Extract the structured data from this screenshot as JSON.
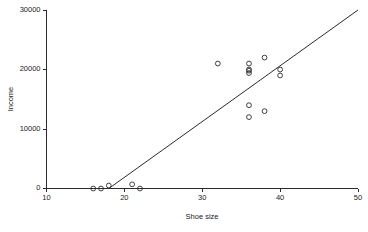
{
  "chart_data": {
    "type": "scatter",
    "title": "",
    "xlabel": "Shoe size",
    "ylabel": "Income",
    "xlim": [
      10,
      50
    ],
    "ylim": [
      0,
      30000
    ],
    "xticks": [
      10,
      20,
      30,
      40,
      50
    ],
    "yticks": [
      0,
      10000,
      20000,
      30000
    ],
    "xtick_labels": [
      "10",
      "20",
      "30",
      "40",
      "50"
    ],
    "ytick_labels": [
      "0",
      "10000",
      "20000",
      "30000"
    ],
    "grid": false,
    "legend": false,
    "marker": "open-circle",
    "marker_color": "#2b2b2b",
    "points": [
      {
        "x": 16,
        "y": 0
      },
      {
        "x": 17,
        "y": 0
      },
      {
        "x": 18,
        "y": 500
      },
      {
        "x": 21,
        "y": 700
      },
      {
        "x": 22,
        "y": 0
      },
      {
        "x": 32,
        "y": 21000
      },
      {
        "x": 36,
        "y": 21000
      },
      {
        "x": 36,
        "y": 20000
      },
      {
        "x": 36,
        "y": 19800
      },
      {
        "x": 36,
        "y": 19400
      },
      {
        "x": 36,
        "y": 14000
      },
      {
        "x": 36,
        "y": 12000
      },
      {
        "x": 38,
        "y": 22000
      },
      {
        "x": 38,
        "y": 13000
      },
      {
        "x": 40,
        "y": 20000
      },
      {
        "x": 40,
        "y": 19000
      }
    ],
    "series": [
      {
        "name": "fit-line",
        "type": "line",
        "x": [
          18,
          50
        ],
        "y": [
          0,
          30000
        ]
      }
    ]
  },
  "axes": {
    "x_title": "Shoe size",
    "y_title": "Income"
  }
}
